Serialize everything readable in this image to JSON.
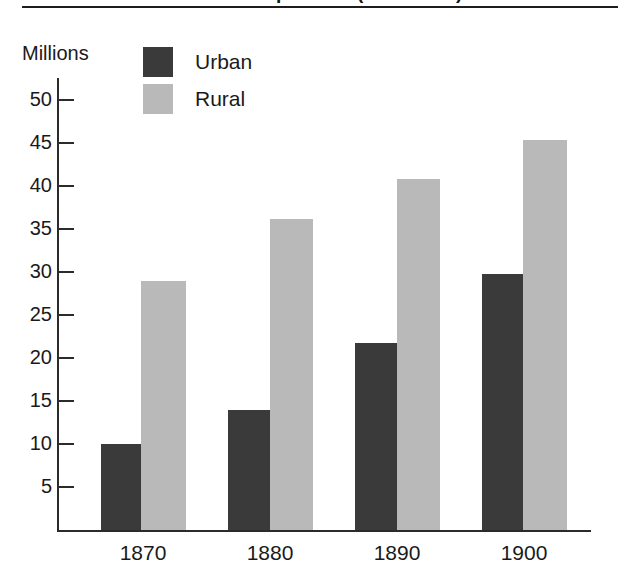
{
  "figure": {
    "title_cropped": "Urban and Rural Population (1870-1900)",
    "rule_color": "#1d1d1d"
  },
  "colors": {
    "urban": "#3a3a3a",
    "rural": "#b9b9b9",
    "axis": "#2b2b2b",
    "text": "#1a1a1a",
    "background": "#ffffff"
  },
  "legend": {
    "position": "top-left-inside",
    "entries": [
      {
        "label": "Urban",
        "color": "#3a3a3a"
      },
      {
        "label": "Rural",
        "color": "#b9b9b9"
      }
    ]
  },
  "chart_data": {
    "type": "bar",
    "title": "Urban and Rural Population (1870-1900)",
    "xlabel": "",
    "ylabel": "Millions",
    "categories": [
      "1870",
      "1880",
      "1890",
      "1900"
    ],
    "series": [
      {
        "name": "Urban",
        "color": "#3a3a3a",
        "values": [
          10.0,
          14.0,
          21.7,
          29.8
        ]
      },
      {
        "name": "Rural",
        "color": "#b9b9b9",
        "values": [
          29.0,
          36.2,
          40.8,
          45.4
        ]
      }
    ],
    "ylim": [
      0,
      52
    ],
    "yticks": [
      5,
      10,
      15,
      20,
      25,
      30,
      35,
      40,
      45,
      50
    ],
    "ytick_labels": [
      "5",
      "10",
      "15",
      "20",
      "25",
      "30",
      "35",
      "40",
      "45",
      "50"
    ],
    "grid": false,
    "legend_entries": [
      "Urban",
      "Rural"
    ]
  }
}
